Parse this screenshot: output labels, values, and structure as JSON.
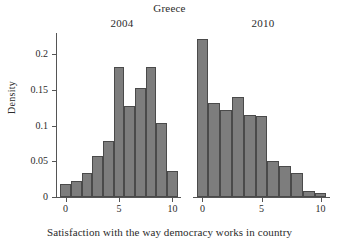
{
  "chart_data": {
    "type": "bar",
    "title": "Greece",
    "xlabel": "Satisfaction with the way democracy works in country",
    "ylabel": "Density",
    "ylim": [
      0,
      0.23
    ],
    "xlim": [
      -0.8,
      10.8
    ],
    "grid": false,
    "legend": null,
    "yticks": [
      0,
      0.05,
      0.1,
      0.15,
      0.2
    ],
    "ytick_labels": [
      "0",
      "0.05",
      "0.1",
      "0.15",
      "0.2"
    ],
    "xticks": [
      0,
      5,
      10
    ],
    "xtick_labels": [
      "0",
      "5",
      "10"
    ],
    "panels": [
      {
        "label": "2004",
        "categories": [
          0,
          1,
          2,
          3,
          4,
          5,
          6,
          7,
          8,
          9,
          10
        ],
        "values": [
          0.018,
          0.023,
          0.034,
          0.057,
          0.078,
          0.182,
          0.127,
          0.153,
          0.182,
          0.104,
          0.037
        ]
      },
      {
        "label": "2010",
        "categories": [
          0,
          1,
          2,
          3,
          4,
          5,
          6,
          7,
          8,
          9,
          10
        ],
        "values": [
          0.221,
          0.132,
          0.122,
          0.14,
          0.115,
          0.113,
          0.05,
          0.044,
          0.033,
          0.009,
          0.006
        ]
      }
    ],
    "colors": {
      "bar_fill": "#7d7d7d",
      "bar_edge": "#4a4a4a",
      "axis": "#555555",
      "text": "#2b2b2b",
      "background": "#ffffff"
    }
  }
}
